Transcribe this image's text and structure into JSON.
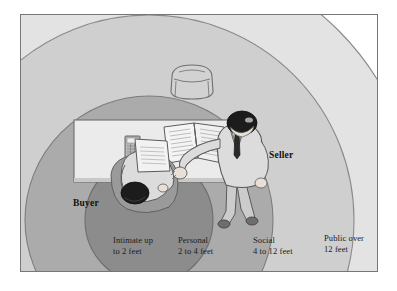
{
  "figure": {
    "border_color": "#777777",
    "background": "#ffffff"
  },
  "people": [
    {
      "id": "buyer",
      "label": "Buyer",
      "role": "seated-at-desk"
    },
    {
      "id": "seller",
      "label": "Seller",
      "role": "standing"
    }
  ],
  "zones": [
    {
      "id": "intimate",
      "name_line1": "Intimate up",
      "name_line2": "to 2 feet",
      "color": "#8c8c8c",
      "range_feet": [
        0,
        2
      ]
    },
    {
      "id": "personal",
      "name_line1": "Personal",
      "name_line2": "2 to 4 feet",
      "color": "#ababab",
      "range_feet": [
        2,
        4
      ]
    },
    {
      "id": "social",
      "name_line1": "Social",
      "name_line2": "4 to 12 feet",
      "color": "#cfcfcf",
      "range_feet": [
        4,
        12
      ]
    },
    {
      "id": "public",
      "name_line1": "Public over",
      "name_line2": "12 feet",
      "color": "#e3e3e3",
      "range_feet": [
        12,
        null
      ]
    }
  ],
  "objects": [
    {
      "id": "desk",
      "name": "desk",
      "color": "#ebebeb"
    },
    {
      "id": "chair",
      "name": "chair",
      "color": "#d2d2d2"
    },
    {
      "id": "open-book",
      "name": "open-book-on-desk",
      "color": "#f4f4f4"
    },
    {
      "id": "calculator",
      "name": "calculator-on-desk",
      "color": "#b9b9b9"
    },
    {
      "id": "document",
      "name": "document-held-by-buyer",
      "color": "#f2f2f2"
    }
  ],
  "colors": {
    "intimate": "#8c8c8c",
    "personal": "#ababab",
    "social": "#cfcfcf",
    "public": "#e3e3e3",
    "outline": "#6f6f6f",
    "text": "#1b1b1b",
    "skin": "#e8e0d6",
    "hair": "#1c1c1c",
    "suit": "#d9d9d9",
    "suit_dark": "#8f8f8f"
  }
}
